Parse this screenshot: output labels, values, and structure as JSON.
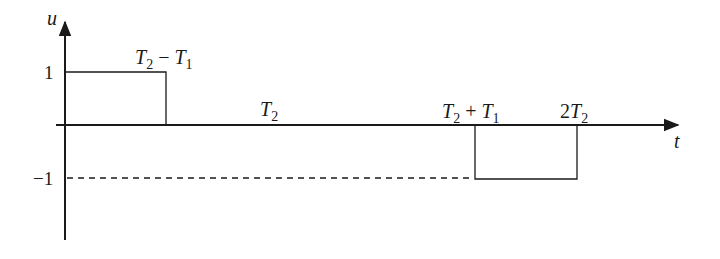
{
  "diagram": {
    "type": "piecewise-signal",
    "axes": {
      "y_label": "u",
      "x_label": "t",
      "y_ticks": [
        {
          "value": 1,
          "label": "1"
        },
        {
          "value": -1,
          "label": "−1"
        }
      ]
    },
    "labels": {
      "t2_minus_t1": {
        "base": "T",
        "sub": "2",
        "op": " − ",
        "base2": "T",
        "sub2": "1"
      },
      "t2": {
        "base": "T",
        "sub": "2"
      },
      "t2_plus_t1": {
        "base": "T",
        "sub": "2",
        "op": " + ",
        "base2": "T",
        "sub2": "1"
      },
      "two_t2": {
        "coef": "2",
        "base": "T",
        "sub": "2"
      }
    },
    "segments": [
      {
        "from": "0",
        "to": "T2 − T1",
        "value": 1
      },
      {
        "from": "T2 − T1",
        "to": "T2 + T1",
        "value": 0
      },
      {
        "from": "T2 + T1",
        "to": "2T2",
        "value": -1
      }
    ],
    "dashed_reference": {
      "level": -1,
      "from": "0",
      "to": "T2 + T1"
    },
    "colors": {
      "line": "#1a1a1a",
      "background": "#ffffff"
    }
  }
}
